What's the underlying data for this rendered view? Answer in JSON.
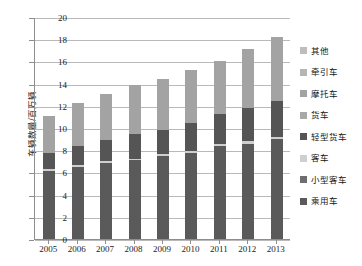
{
  "chart_data": {
    "type": "bar",
    "stacked": true,
    "title": "",
    "xlabel": "",
    "ylabel": "车辆数量/百万辆",
    "ylim": [
      0,
      20
    ],
    "ytick_step": 2,
    "ytick_labels": [
      "0",
      "2",
      "4",
      "6",
      "8",
      "10",
      "12",
      "14",
      "16",
      "18",
      "20"
    ],
    "grid": true,
    "legend_position": "right",
    "categories": [
      "2005",
      "2006",
      "2007",
      "2008",
      "2009",
      "2010",
      "2011",
      "2012",
      "2013"
    ],
    "series": [
      {
        "name": "乘用车",
        "color": "#5a5a5a",
        "values": [
          6.15,
          6.5,
          6.85,
          7.1,
          7.5,
          7.75,
          8.35,
          8.6,
          9.0
        ]
      },
      {
        "name": "小型客车",
        "color": "#6e6e6e",
        "values": [
          0.0,
          0.0,
          0.0,
          0.0,
          0.0,
          0.0,
          0.0,
          0.0,
          0.0
        ]
      },
      {
        "name": "客车",
        "color": "#cfcfcf",
        "values": [
          0.12,
          0.15,
          0.15,
          0.15,
          0.15,
          0.18,
          0.2,
          0.22,
          0.22
        ]
      },
      {
        "name": "轻型货车",
        "color": "#555555",
        "values": [
          1.45,
          1.7,
          1.9,
          2.2,
          2.2,
          2.55,
          2.75,
          3.0,
          3.2
        ]
      },
      {
        "name": "货车",
        "color": "#a8a8a8",
        "values": [
          0.0,
          0.0,
          0.0,
          0.0,
          0.0,
          0.0,
          0.0,
          0.0,
          0.0
        ]
      },
      {
        "name": "摩托车",
        "color": "#a3a3a3",
        "values": [
          3.4,
          3.9,
          4.15,
          4.4,
          4.6,
          4.75,
          4.75,
          5.3,
          5.8
        ]
      },
      {
        "name": "牵引车",
        "color": "#b5b5b5",
        "values": [
          0.0,
          0.0,
          0.0,
          0.0,
          0.0,
          0.0,
          0.0,
          0.0,
          0.0
        ]
      },
      {
        "name": "其他",
        "color": "#bdbdbd",
        "values": [
          0.0,
          0.0,
          0.0,
          0.0,
          0.0,
          0.0,
          0.0,
          0.0,
          0.0
        ]
      }
    ],
    "totals": [
      11.12,
      12.25,
      13.05,
      13.85,
      14.45,
      15.23,
      16.05,
      17.12,
      18.22
    ]
  },
  "legend": {
    "items": [
      {
        "label": "其他",
        "color": "#bdbdbd"
      },
      {
        "label": "牵引车",
        "color": "#b5b5b5"
      },
      {
        "label": "摩托车",
        "color": "#a3a3a3"
      },
      {
        "label": "货车",
        "color": "#a8a8a8"
      },
      {
        "label": "轻型货车",
        "color": "#555555"
      },
      {
        "label": "客车",
        "color": "#cfcfcf"
      },
      {
        "label": "小型客车",
        "color": "#6e6e6e"
      },
      {
        "label": "乘用车",
        "color": "#5a5a5a"
      }
    ]
  }
}
